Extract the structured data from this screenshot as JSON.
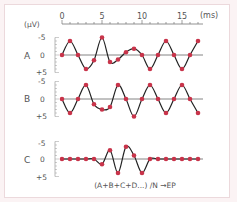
{
  "chart_data": {
    "type": "line",
    "title": "",
    "xlabel": "(ms)",
    "ylabel": "(μV)",
    "x_ticks": [
      "0",
      "5",
      "10",
      "15"
    ],
    "xlim": [
      0,
      17
    ],
    "y_ticks": [
      "-5",
      "0",
      "+5"
    ],
    "ylim": [
      5,
      -5
    ],
    "y_inverted": true,
    "grid": false,
    "x": [
      0,
      1,
      2,
      3,
      4,
      5,
      6,
      7,
      8,
      9,
      10,
      11,
      12,
      13,
      14,
      15,
      16,
      17
    ],
    "series": [
      {
        "name": "A",
        "values": [
          0,
          -4,
          0,
          4,
          1.5,
          -5,
          2,
          1.3,
          -0.8,
          -1.8,
          0,
          4,
          0,
          -4,
          0,
          4,
          0,
          -4
        ]
      },
      {
        "name": "B",
        "values": [
          0,
          4,
          0,
          -4,
          1.5,
          3,
          2.3,
          -4,
          0,
          5,
          0,
          -4,
          0,
          4,
          0,
          -4,
          0,
          4
        ]
      },
      {
        "name": "C",
        "values": [
          0,
          0,
          0,
          0,
          0,
          1.5,
          -2.5,
          4,
          -3.5,
          -1,
          4,
          0,
          0,
          0,
          0,
          0,
          0,
          0
        ]
      }
    ],
    "annotation": "(A+B+C+D...) /N →EP",
    "colors": {
      "line": "#222222",
      "marker": "#c8344a",
      "baseline": "#777777"
    }
  },
  "labels": {
    "unit_y": "(μV)",
    "unit_x": "(ms)",
    "series_a": "A",
    "series_b": "B",
    "series_c": "C",
    "tick_neg5": "-5",
    "tick_0": "0",
    "tick_pos5": "+5",
    "x0": "0",
    "x5": "5",
    "x10": "10",
    "x15": "15",
    "formula": "(A+B+C+D...) /N →EP"
  }
}
